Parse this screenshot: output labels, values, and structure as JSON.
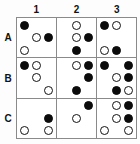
{
  "colors": {
    "filled_dot": "#0b0b0b",
    "open_dot_fill": "#ffffff",
    "open_dot_stroke": "#121212",
    "grid_line": "#8a8a8a",
    "background": "#ffffff",
    "label_text": "#111111"
  },
  "column_headers": [
    {
      "label": "1"
    },
    {
      "label": "2"
    },
    {
      "label": "3"
    }
  ],
  "row_headers": [
    {
      "label": "A"
    },
    {
      "label": "B"
    },
    {
      "label": "C"
    }
  ],
  "legend": {
    "filled_name": "filled-dot",
    "open_name": "open-dot",
    "empty_name": "empty-slot"
  },
  "cells": [
    {
      "id": "A1",
      "row": "A",
      "column": "1",
      "dots": [
        [
          "filled",
          "empty",
          "empty"
        ],
        [
          "empty",
          "open",
          "filled"
        ],
        [
          "open",
          "empty",
          "empty"
        ]
      ],
      "filled_count": 2,
      "open_count": 2
    },
    {
      "id": "A2",
      "row": "A",
      "column": "2",
      "dots": [
        [
          "empty",
          "open",
          "empty"
        ],
        [
          "empty",
          "open",
          "filled"
        ],
        [
          "empty",
          "filled",
          "empty"
        ]
      ],
      "filled_count": 2,
      "open_count": 2
    },
    {
      "id": "A3",
      "row": "A",
      "column": "3",
      "dots": [
        [
          "filled",
          "open",
          "empty"
        ],
        [
          "empty",
          "empty",
          "empty"
        ],
        [
          "open",
          "filled",
          "empty"
        ]
      ],
      "filled_count": 2,
      "open_count": 2
    },
    {
      "id": "B1",
      "row": "B",
      "column": "1",
      "dots": [
        [
          "filled",
          "open",
          "empty"
        ],
        [
          "empty",
          "open",
          "empty"
        ],
        [
          "empty",
          "empty",
          "open"
        ]
      ],
      "filled_count": 1,
      "open_count": 3
    },
    {
      "id": "B2",
      "row": "B",
      "column": "2",
      "dots": [
        [
          "empty",
          "open",
          "filled"
        ],
        [
          "empty",
          "empty",
          "filled"
        ],
        [
          "empty",
          "filled",
          "empty"
        ]
      ],
      "filled_count": 3,
      "open_count": 1
    },
    {
      "id": "B3",
      "row": "B",
      "column": "3",
      "dots": [
        [
          "filled",
          "empty",
          "filled"
        ],
        [
          "empty",
          "open",
          "filled"
        ],
        [
          "empty",
          "filled",
          "open"
        ]
      ],
      "filled_count": 4,
      "open_count": 2
    },
    {
      "id": "C1",
      "row": "C",
      "column": "1",
      "dots": [
        [
          "empty",
          "empty",
          "empty"
        ],
        [
          "empty",
          "empty",
          "filled"
        ],
        [
          "open",
          "empty",
          "open"
        ]
      ],
      "filled_count": 1,
      "open_count": 2
    },
    {
      "id": "C2",
      "row": "C",
      "column": "2",
      "dots": [
        [
          "empty",
          "empty",
          "filled"
        ],
        [
          "empty",
          "open",
          "empty"
        ],
        [
          "empty",
          "empty",
          "empty"
        ]
      ],
      "filled_count": 1,
      "open_count": 1
    },
    {
      "id": "C3",
      "row": "C",
      "column": "3",
      "dots": [
        [
          "empty",
          "open",
          "filled"
        ],
        [
          "empty",
          "open",
          "filled"
        ],
        [
          "open",
          "empty",
          "open"
        ]
      ],
      "filled_count": 2,
      "open_count": 4
    }
  ]
}
